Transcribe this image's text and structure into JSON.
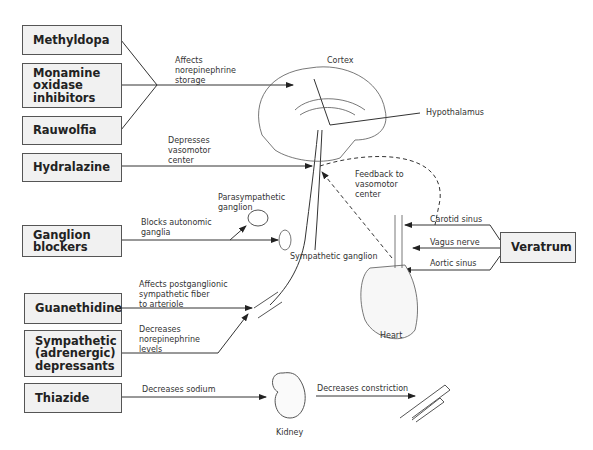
{
  "drugs": {
    "methyldopa": "Methyldopa",
    "mao": "Monamine\noxidase\ninhibitors",
    "rauwolfia": "Rauwolfia",
    "hydralazine": "Hydralazine",
    "ganglion_blockers": "Ganglion\nblockers",
    "guanethidine": "Guanethidine",
    "sympathetic_depressants": "Sympathetic\n(adrenergic)\ndepressants",
    "thiazide": "Thiazide",
    "veratrum": "Veratrum"
  },
  "actions": {
    "storage": "Affects\nnorepinephrine\nstorage",
    "vasomotor": "Depresses\nvasomotor\ncenter",
    "autonomic": "Blocks autonomic\nganglia",
    "postganglionic": "Affects postganglionic\nsympathetic fiber\nto arteriole",
    "ne_levels": "Decreases\nnorepinephrine\nlevels",
    "sodium": "Decreases sodium",
    "constriction": "Decreases constriction",
    "feedback": "Feedback to\nvasomotor\ncenter"
  },
  "anatomy": {
    "cortex": "Cortex",
    "hypothalamus": "Hypothalamus",
    "parasympathetic_ganglion": "Parasympathetic\nganglion",
    "sympathetic_ganglion": "Sympathetic ganglion",
    "carotid_sinus": "Carotid sinus",
    "vagus_nerve": "Vagus nerve",
    "aortic_sinus": "Aortic sinus",
    "heart": "Heart",
    "kidney": "Kidney"
  }
}
